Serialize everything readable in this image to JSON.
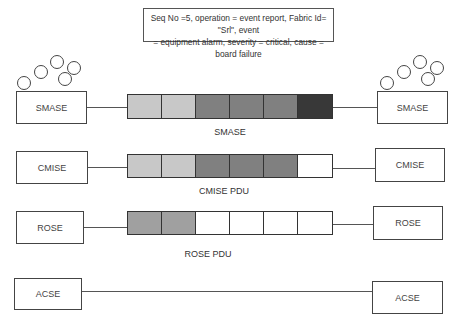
{
  "note": {
    "line1": "Seq No =5, operation = event report, Fabric Id= \"Srl\", event",
    "line2": "= equipment alarm, severity = critical,  cause = board failure"
  },
  "layers": [
    {
      "left_label": "SMASE",
      "right_label": "SMASE",
      "pdu_label": "SMASE",
      "cells": [
        "#c8c8c8",
        "#c8c8c8",
        "#808080",
        "#808080",
        "#808080",
        "#383838"
      ]
    },
    {
      "left_label": "CMISE",
      "right_label": "CMISE",
      "pdu_label": "CMISE PDU",
      "cells": [
        "#c8c8c8",
        "#c8c8c8",
        "#808080",
        "#808080",
        "#808080",
        "#ffffff"
      ]
    },
    {
      "left_label": "ROSE",
      "right_label": "ROSE",
      "pdu_label": "ROSE PDU",
      "cells": [
        "#a0a0a0",
        "#a0a0a0",
        "#ffffff",
        "#ffffff",
        "#ffffff",
        "#ffffff"
      ]
    },
    {
      "left_label": "ACSE",
      "right_label": "ACSE",
      "pdu_label": ""
    }
  ],
  "icons": {
    "left": "managed-object-cluster-icon",
    "right": "managed-object-cluster-icon"
  }
}
